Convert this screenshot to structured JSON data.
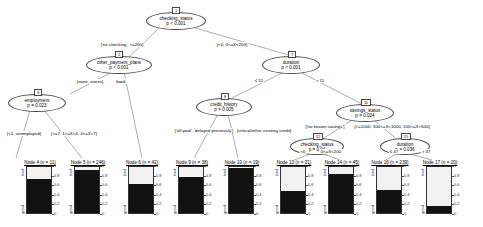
{
  "chart_data": {
    "type": "tree",
    "title": "",
    "colors": {
      "good": "#111111",
      "bad": "#f2f2f2",
      "edge": "#666666"
    },
    "inner_nodes": [
      {
        "id": "1",
        "variable": "checking_status",
        "p": "p < 0.001"
      },
      {
        "id": "2",
        "variable": "other_payment_plans",
        "p": "p < 0.001"
      },
      {
        "id": "3",
        "variable": "employment",
        "p": "p = 0.023"
      },
      {
        "id": "7",
        "variable": "duration",
        "p": "p < 0.001"
      },
      {
        "id": "8",
        "variable": "credit_history",
        "p": "p = 0.005"
      },
      {
        "id": "11",
        "variable": "savings_status",
        "p": "p = 0.024"
      },
      {
        "id": "12",
        "variable": "checking_status",
        "p": "p = 0.04"
      },
      {
        "id": "15",
        "variable": "duration",
        "p": "p = 0.036"
      }
    ],
    "edges": [
      {
        "from": "1",
        "to": "2",
        "label": "{'no checking', >=200}"
      },
      {
        "from": "1",
        "to": "7",
        "label": "{<0, 0<=X<200}"
      },
      {
        "from": "2",
        "to": "3",
        "label": "{none, stores}"
      },
      {
        "from": "2",
        "to": "6",
        "label": "bank"
      },
      {
        "from": "3",
        "to": "4",
        "label": "{<1, unemployed}"
      },
      {
        "from": "3",
        "to": "5",
        "label": "{>=7, 1<=X<4, 4<=X<7}"
      },
      {
        "from": "7",
        "to": "8",
        "label": "≤ 11"
      },
      {
        "from": "7",
        "to": "11",
        "label": "> 11"
      },
      {
        "from": "8",
        "to": "9",
        "label": "{'all paid', 'delayed previously'}"
      },
      {
        "from": "8",
        "to": "10",
        "label": "{critical/other existing credit}"
      },
      {
        "from": "11",
        "to": "12",
        "label": "{'no known savings'}"
      },
      {
        "from": "11",
        "to": "15",
        "label": "{>=1000, 500<=X<1000, 100<=X<500}"
      },
      {
        "from": "12",
        "to": "13",
        "label": "<0"
      },
      {
        "from": "12",
        "to": "14",
        "label": "0<=X<200"
      },
      {
        "from": "15",
        "to": "16",
        "label": "≤ 47"
      },
      {
        "from": "15",
        "to": "17",
        "label": "> 47"
      }
    ],
    "leaves": [
      {
        "id": "4",
        "title": "Node 4 (n = 11)",
        "n": 11,
        "good": 0.73,
        "bad": 0.27
      },
      {
        "id": "5",
        "title": "Node 5 (n = 246)",
        "n": 246,
        "good": 0.93,
        "bad": 0.07
      },
      {
        "id": "6",
        "title": "Node 6 (n = 42)",
        "n": 42,
        "good": 0.62,
        "bad": 0.38
      },
      {
        "id": "9",
        "title": "Node 9 (n = 38)",
        "n": 38,
        "good": 0.79,
        "bad": 0.21
      },
      {
        "id": "10",
        "title": "Node 10 (n = 19)",
        "n": 19,
        "good": 0.98,
        "bad": 0.02
      },
      {
        "id": "13",
        "title": "Node 13 (n = 21)",
        "n": 21,
        "good": 0.48,
        "bad": 0.52
      },
      {
        "id": "14",
        "title": "Node 14 (n = 45)",
        "n": 45,
        "good": 0.84,
        "bad": 0.16
      },
      {
        "id": "16",
        "title": "Node 16 (n = 239)",
        "n": 239,
        "good": 0.49,
        "bad": 0.51
      },
      {
        "id": "17",
        "title": "Node 17 (n = 20)",
        "n": 20,
        "good": 0.15,
        "bad": 0.85
      }
    ],
    "axis_ticks": [
      "1",
      "0.8",
      "0.6",
      "0.4",
      "0.2",
      "0"
    ],
    "class_labels": {
      "top": "bad",
      "bottom": "good"
    }
  }
}
